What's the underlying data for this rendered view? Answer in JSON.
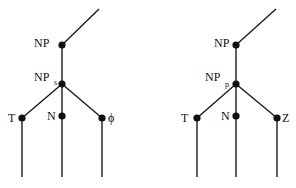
{
  "diagram": {
    "type": "tree",
    "trees": [
      {
        "id": "left",
        "nodes": {
          "top_end": {
            "x": 99,
            "y": 9
          },
          "np": {
            "x": 62,
            "y": 45,
            "label": "NP"
          },
          "np_sub": {
            "x": 62,
            "y": 84,
            "label": "NP",
            "subscript": "s"
          },
          "t": {
            "x": 22,
            "y": 118,
            "label": "T"
          },
          "n": {
            "x": 62,
            "y": 116,
            "label": "N"
          },
          "third": {
            "x": 102,
            "y": 118,
            "label": "ϕ"
          }
        },
        "leaf_bottom_y": 177
      },
      {
        "id": "right",
        "nodes": {
          "top_end": {
            "x": 276,
            "y": 9
          },
          "np": {
            "x": 236,
            "y": 45,
            "label": "NP"
          },
          "np_sub": {
            "x": 236,
            "y": 84,
            "label": "NP",
            "subscript": "p"
          },
          "t": {
            "x": 197,
            "y": 118,
            "label": "T"
          },
          "n": {
            "x": 236,
            "y": 116,
            "label": "N"
          },
          "third": {
            "x": 277,
            "y": 118,
            "label": "Z"
          }
        },
        "leaf_bottom_y": 177
      }
    ]
  },
  "labels": {
    "left_np": "NP",
    "left_nps": "NP",
    "left_nps_sub": "s",
    "left_t": "T",
    "left_n": "N",
    "left_phi": "ϕ",
    "right_np": "NP",
    "right_npp": "NP",
    "right_npp_sub": "p",
    "right_t": "T",
    "right_n": "N",
    "right_z": "Z"
  }
}
